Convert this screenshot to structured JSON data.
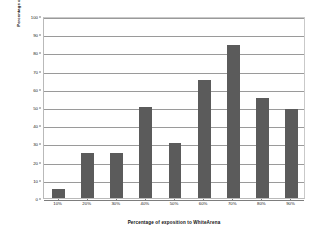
{
  "chart_data": {
    "type": "bar",
    "title": "",
    "xlabel": "Percentage of exposition to WhiteArena",
    "ylabel": "Percentage of rabats",
    "categories": [
      "10%",
      "20%",
      "30%",
      "40%",
      "50%",
      "60%",
      "70%",
      "80%",
      "90%"
    ],
    "values": [
      5,
      25,
      25,
      50,
      30,
      65,
      84,
      55,
      49
    ],
    "ylim": [
      0,
      100
    ],
    "ytick_labels": [
      "0",
      "10",
      "20",
      "30",
      "40",
      "50",
      "60",
      "70",
      "80",
      "90",
      "100"
    ],
    "ytick_values": [
      0,
      10,
      20,
      30,
      40,
      50,
      60,
      70,
      80,
      90,
      100
    ],
    "grid": true,
    "legend": false,
    "series": [
      {
        "name": "Percentage of rabats",
        "color": "#5b5b5b",
        "values": [
          5,
          25,
          25,
          50,
          30,
          65,
          84,
          55,
          49
        ]
      }
    ]
  },
  "figure": {
    "background_color": "#ffffff",
    "plot_border_color": "#b9b9b9",
    "gridline_color": "#9a9a9a",
    "bar_color": "#5b5b5b",
    "text_color": "#1a1a1a"
  }
}
